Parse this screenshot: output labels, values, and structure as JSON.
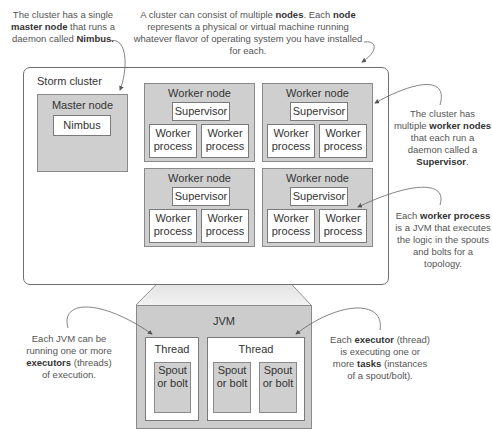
{
  "annotations": {
    "master": {
      "pre": "The cluster has a single ",
      "b1": "master node",
      "mid": " that runs a daemon called ",
      "b2": "Nimbus."
    },
    "nodes": {
      "pre": "A cluster can consist of multiple ",
      "b1": "nodes",
      "mid": ". Each ",
      "b2": "node",
      "post": " represents a physical or virtual machine running whatever flavor of operating system you have installed for each."
    },
    "workers": {
      "pre": "The cluster has multiple ",
      "b1": "worker nodes",
      "mid": " that each run a daemon called a ",
      "b2": "Supervisor",
      "post": "."
    },
    "process": {
      "pre": "Each ",
      "b1": "worker process",
      "post": " is a JVM that executes the logic in the spouts and bolts for a topology."
    },
    "jvm": {
      "pre": "Each JVM can be running one or more ",
      "b1": "executors",
      "post": " (threads) of execution."
    },
    "executor": {
      "pre": "Each ",
      "b1": "executor",
      "mid": " (thread) is executing one or more ",
      "b2": "tasks",
      "post": " (instances of a spout/bolt)."
    }
  },
  "cluster": {
    "title": "Storm cluster",
    "master": {
      "title": "Master node",
      "daemon": "Nimbus"
    },
    "workers": [
      {
        "title": "Worker node",
        "supervisor": "Supervisor",
        "processes": [
          "Worker process",
          "Worker process"
        ]
      },
      {
        "title": "Worker node",
        "supervisor": "Supervisor",
        "processes": [
          "Worker process",
          "Worker process"
        ]
      },
      {
        "title": "Worker node",
        "supervisor": "Supervisor",
        "processes": [
          "Worker process",
          "Worker process"
        ]
      },
      {
        "title": "Worker node",
        "supervisor": "Supervisor",
        "processes": [
          "Worker process",
          "Worker process"
        ]
      }
    ]
  },
  "jvm": {
    "title": "JVM",
    "threads": [
      {
        "title": "Thread",
        "tasks": [
          "Spout or bolt"
        ]
      },
      {
        "title": "Thread",
        "tasks": [
          "Spout or bolt",
          "Spout or bolt"
        ]
      }
    ]
  }
}
